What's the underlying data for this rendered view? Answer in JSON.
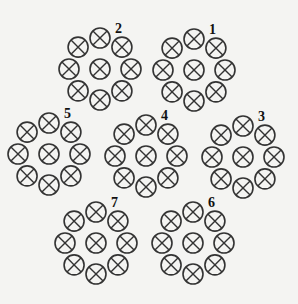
{
  "diagram": {
    "symbol": "circle-cross",
    "stroke_color": "#333333",
    "background": "#f4f4f2",
    "conductor_radius": 10,
    "ring_radius": 31,
    "groups": [
      {
        "label": "1",
        "cx": 194,
        "cy": 70
      },
      {
        "label": "2",
        "cx": 100,
        "cy": 69
      },
      {
        "label": "3",
        "cx": 243,
        "cy": 157
      },
      {
        "label": "4",
        "cx": 146,
        "cy": 156
      },
      {
        "label": "5",
        "cx": 49,
        "cy": 154
      },
      {
        "label": "6",
        "cx": 193,
        "cy": 243
      },
      {
        "label": "7",
        "cx": 96,
        "cy": 243
      }
    ]
  }
}
